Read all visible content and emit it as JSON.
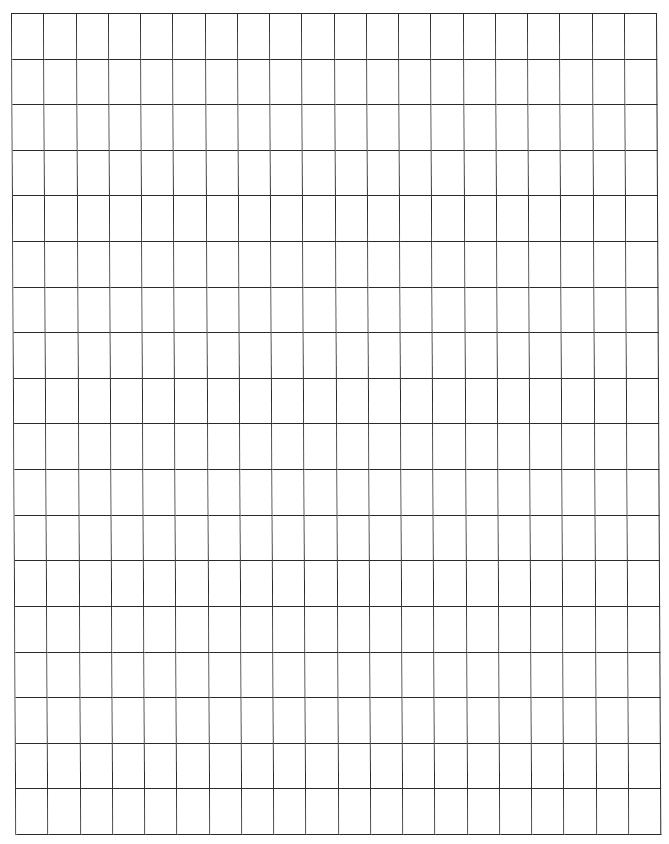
{
  "document": {
    "type": "graph-paper",
    "grid": {
      "rows": 18,
      "columns": 20,
      "line_color": "#2a2a2a",
      "background_color": "#ffffff"
    }
  }
}
